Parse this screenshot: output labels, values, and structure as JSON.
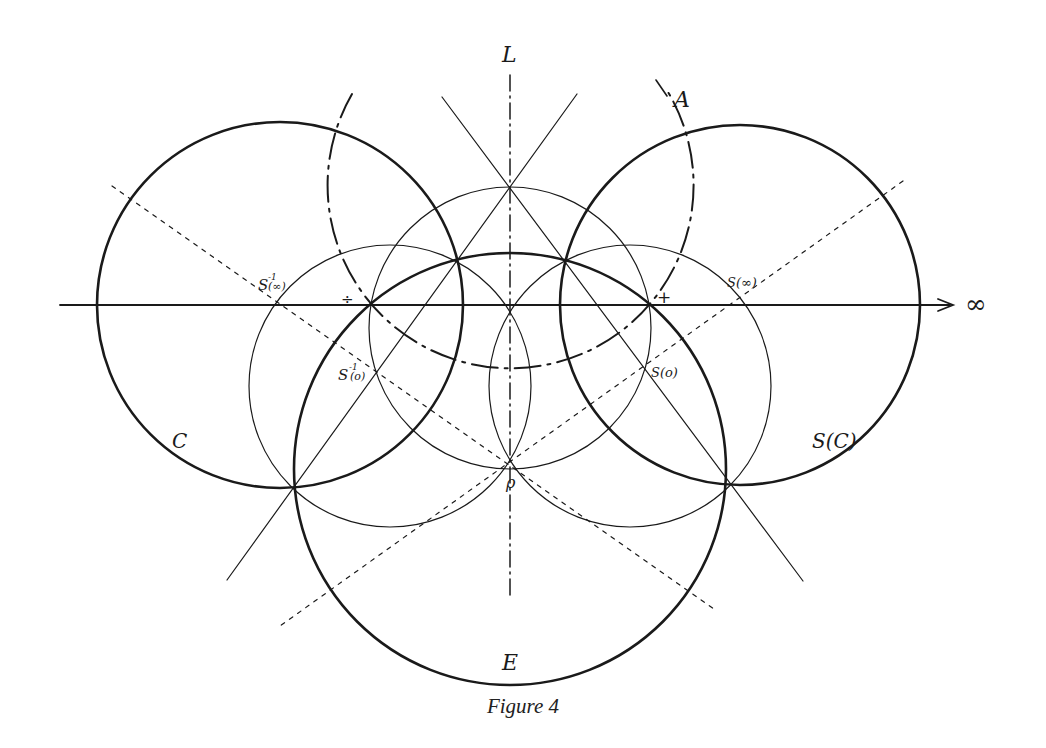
{
  "figure": {
    "caption": "Figure 4",
    "colors": {
      "ink": "#1a1a1a",
      "background": "#ffffff"
    },
    "labels": {
      "L": "L",
      "A": "A",
      "infinity": "∞",
      "C": "C",
      "SC": "S(C)",
      "E": "E",
      "rho": "ρ",
      "minus": "÷",
      "plus": "+",
      "S_inf": "S(∞)",
      "S_zero": "S(o)",
      "Sinv_inf_base": "S",
      "Sinv_inf_sup": "-1",
      "Sinv_inf_arg": "(∞)",
      "Sinv_zero_base": "S",
      "Sinv_zero_sup": "-1",
      "Sinv_zero_arg": "(o)"
    },
    "elements": {
      "axis_horizontal": "real axis with arrow toward ∞",
      "axis_vertical": "dash-dot line L",
      "bold_circles": [
        "C",
        "S(C)",
        "E"
      ],
      "thin_circles": 3,
      "dash_dot_arc": "A",
      "dotted_lines": 2,
      "solid_diagonals": 2
    }
  }
}
